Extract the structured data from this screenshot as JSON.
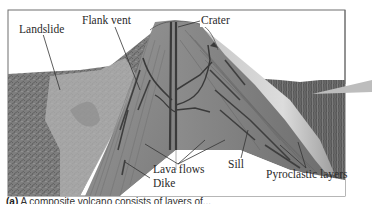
{
  "figure": {
    "labels": {
      "landslide": "Landslide",
      "flank_vent": "Flank vent",
      "crater": "Crater",
      "lava_flows": "Lava flows",
      "sill": "Sill",
      "dike": "Dike",
      "pyroclastic_layers": "Pyroclastic layers"
    },
    "caption": {
      "marker": "(a)",
      "text": "A composite volcano consists of layers of..."
    },
    "colors": {
      "frame": "#6e6e6e",
      "cone": "#8a8a8a",
      "cone_light": "#b9b9b9",
      "conduit": "#3e3e3e",
      "ground": "#7a7a7a"
    }
  }
}
